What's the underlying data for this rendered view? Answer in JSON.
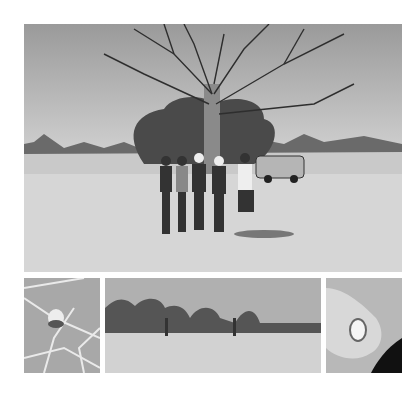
{
  "collage": {
    "style": "grayscale",
    "background": "#ffffff",
    "photos": [
      {
        "id": "main",
        "description": "Group of five people standing in dry grassland beneath a large leafless boab tree, with a white SUV parked to the right"
      },
      {
        "id": "p1",
        "description": "Close-up of a pale fruit or nut hanging among bare branches against the sky"
      },
      {
        "id": "p2",
        "description": "Wide landscape of open dry grassland with scattered trees and a distant tree line"
      },
      {
        "id": "p3",
        "description": "Close-up of a hand holding a cracked open nut showing white interior"
      }
    ]
  }
}
